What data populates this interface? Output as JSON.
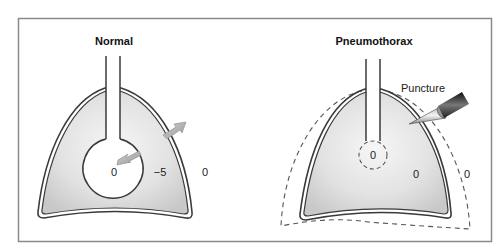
{
  "panels": {
    "normal": {
      "title": "Normal",
      "pressures": {
        "alveolar": "0",
        "intrapleural": "−5",
        "atmospheric": "0"
      }
    },
    "pneumothorax": {
      "title": "Pneumothorax",
      "puncture_label": "Puncture",
      "pressures": {
        "alveolar": "0",
        "intrapleural": "0",
        "atmospheric": "0"
      }
    }
  },
  "colors": {
    "frame": "#8a8a8a",
    "outline": "#3a3a3a",
    "lung_fill_light": "#f2f2f2",
    "lung_fill_dark": "#c9c9c9",
    "arrow": "#a9a9a9",
    "dashed": "#555555"
  }
}
